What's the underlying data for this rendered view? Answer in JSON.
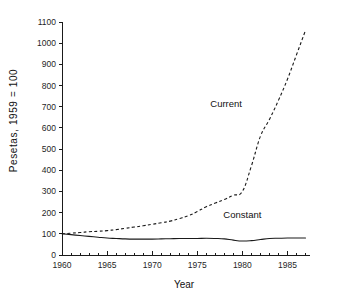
{
  "chart_data": {
    "type": "line",
    "title": "",
    "xlabel": "Year",
    "ylabel": "Pesetas, 1959 = 100",
    "xlim": [
      1960,
      1987.5
    ],
    "ylim": [
      0,
      1100
    ],
    "grid": false,
    "legend_position": "inline-annotation",
    "x": [
      1960,
      1961,
      1962,
      1963,
      1964,
      1965,
      1966,
      1967,
      1968,
      1969,
      1970,
      1971,
      1972,
      1973,
      1974,
      1975,
      1976,
      1977,
      1978,
      1979,
      1980,
      1981,
      1982,
      1983,
      1984,
      1985,
      1986,
      1987
    ],
    "xticks": [
      1960,
      1965,
      1970,
      1975,
      1980,
      1985
    ],
    "xtick_labels": [
      "1960",
      "1965",
      "1970",
      "1975",
      "1980",
      "1985"
    ],
    "xtick_minor_step": 1,
    "yticks": [
      0,
      100,
      200,
      300,
      400,
      500,
      600,
      700,
      800,
      900,
      1000,
      1100
    ],
    "ytick_labels": [
      "0",
      "100",
      "200",
      "300",
      "400",
      "500",
      "600",
      "700",
      "800",
      "900",
      "1000",
      "1100"
    ],
    "series": [
      {
        "name": "Current",
        "style": "dashed",
        "label_x": 1978.2,
        "label_y": 700,
        "values": [
          100,
          103,
          106,
          110,
          112,
          115,
          120,
          126,
          132,
          138,
          145,
          152,
          160,
          172,
          185,
          205,
          228,
          245,
          262,
          282,
          300,
          420,
          560,
          640,
          730,
          830,
          945,
          1060
        ]
      },
      {
        "name": "Constant",
        "style": "solid",
        "label_x": 1980.0,
        "label_y": 175,
        "values": [
          100,
          96,
          92,
          88,
          84,
          80,
          78,
          76,
          75,
          75,
          75,
          76,
          77,
          78,
          78,
          78,
          79,
          78,
          76,
          70,
          66,
          68,
          73,
          78,
          79,
          80,
          80,
          80
        ]
      }
    ]
  },
  "labels": {
    "y_axis_title": "Pesetas, 1959 = 100",
    "x_axis_title": "Year",
    "series_current": "Current",
    "series_constant": "Constant"
  },
  "colors": {
    "axis": "#1a1a1a",
    "line": "#1a1a1a",
    "background": "#ffffff"
  }
}
